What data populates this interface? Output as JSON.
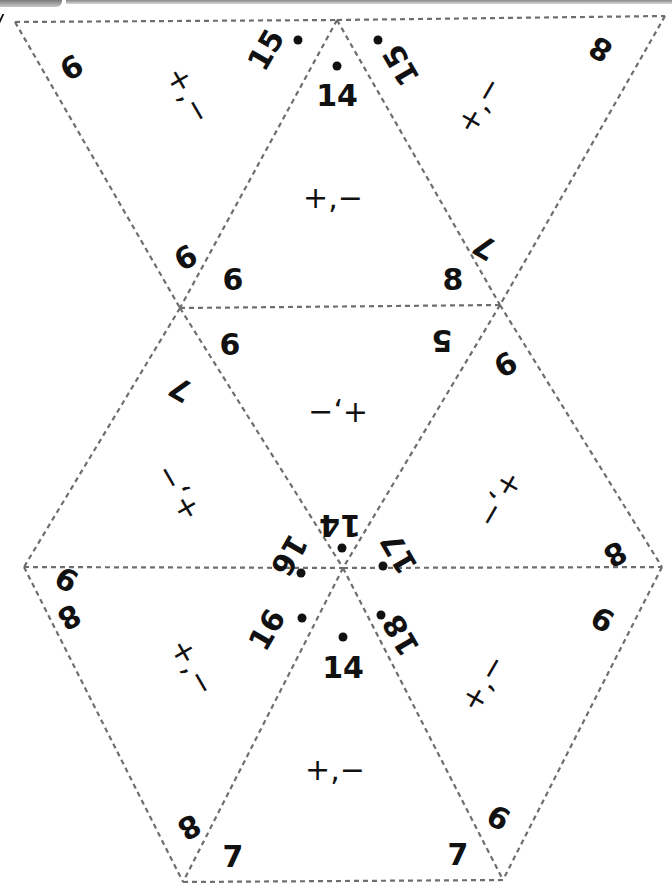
{
  "puzzle": {
    "type": "tarsia-triangle-puzzle",
    "edge_color": "#6e6e6e",
    "text_color": "#111111",
    "operation_label": "+,−",
    "triangles": [
      {
        "id": 1,
        "orientation": "down",
        "edges": [
          "9",
          "15",
          "9"
        ],
        "center": "+,−"
      },
      {
        "id": 2,
        "orientation": "up",
        "edges": [
          "14",
          "6",
          "8"
        ],
        "center": "+,−"
      },
      {
        "id": 3,
        "orientation": "down",
        "edges": [
          "15",
          "8",
          "7"
        ],
        "center": "+,−"
      },
      {
        "id": 4,
        "orientation": "up",
        "edges": [
          "7",
          "9",
          "16"
        ],
        "center": "+,−"
      },
      {
        "id": 5,
        "orientation": "down",
        "edges": [
          "6",
          "5",
          "14"
        ],
        "center": "+,−"
      },
      {
        "id": 6,
        "orientation": "up",
        "edges": [
          "9",
          "17",
          "8"
        ],
        "center": "+,−"
      },
      {
        "id": 7,
        "orientation": "down",
        "edges": [
          "8",
          "16",
          "8"
        ],
        "center": "+,−"
      },
      {
        "id": 8,
        "orientation": "up",
        "edges": [
          "14",
          "7",
          "7"
        ],
        "center": "+,−"
      },
      {
        "id": 9,
        "orientation": "down",
        "edges": [
          "18",
          "9",
          "9"
        ],
        "center": "+,−"
      }
    ]
  },
  "labels": {
    "t1_a": "9",
    "t1_b": "15",
    "t1_c": "9",
    "t1_op": "+,−",
    "t2_a": "14",
    "t2_b": "6",
    "t2_c": "8",
    "t2_op": "+,−",
    "t3_a": "15",
    "t3_b": "8",
    "t3_c": "7",
    "t3_op": "+,−",
    "t4_a": "7",
    "t4_b": "9",
    "t4_c": "16",
    "t4_op": "+,−",
    "t5_a": "6",
    "t5_b": "5",
    "t5_c": "14",
    "t5_op": "+,−",
    "t6_a": "9",
    "t6_b": "17",
    "t6_c": "8",
    "t6_op": "+,−",
    "t7_a": "8",
    "t7_b": "16",
    "t7_c": "8",
    "t7_op": "+,−",
    "t8_a": "14",
    "t8_b": "7",
    "t8_c": "7",
    "t8_op": "+,−",
    "t9_a": "18",
    "t9_b": "9",
    "t9_c": "9",
    "t9_op": "+,−"
  }
}
